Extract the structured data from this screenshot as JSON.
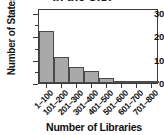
{
  "chart_data": {
    "type": "bar",
    "title": "in the U.S.",
    "title_note": "title is cropped at the top edge of the image",
    "xlabel": "Number of Libraries",
    "ylabel": "Number of States",
    "categories": [
      "1–100",
      "101–200",
      "201–300",
      "301–400",
      "401–500",
      "501–600",
      "601–700",
      "701–800"
    ],
    "values": [
      22,
      11,
      7,
      5,
      2,
      1,
      1,
      1
    ],
    "ylim": [
      0,
      32
    ],
    "yticks": [
      0,
      10,
      20,
      30
    ],
    "ytick_labels": [
      "0",
      "10",
      "20",
      "30"
    ],
    "y_minor_ticks": [
      5,
      15,
      25
    ],
    "grid": false,
    "legend": null,
    "bar_color": "#a9a9a9",
    "bar_edge_color": "#4a4a4a",
    "axis_color": "#3b3b3b",
    "text_color": "#111111",
    "background": "#ffffff"
  }
}
